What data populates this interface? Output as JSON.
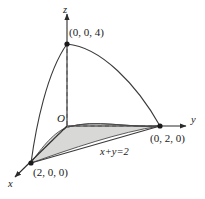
{
  "figure": {
    "axes": {
      "x_label": "x",
      "y_label": "y",
      "z_label": "z",
      "origin_label": "O"
    },
    "points": [
      {
        "name": "z-intercept",
        "label": "(0, 0, 4)",
        "coords": [
          0,
          0,
          4
        ]
      },
      {
        "name": "y-intercept",
        "label": "(0, 2, 0)",
        "coords": [
          0,
          2,
          0
        ]
      },
      {
        "name": "x-intercept",
        "label": "(2, 0, 0)",
        "coords": [
          2,
          0,
          0
        ]
      }
    ],
    "annotations": [
      {
        "name": "plane-equation",
        "label": "x+y=2"
      }
    ],
    "colors": {
      "stroke": "#333333",
      "shaded_region_fill": "#d8d8d6",
      "background": "#ffffff",
      "point_marker": "#1a1a1a"
    }
  }
}
